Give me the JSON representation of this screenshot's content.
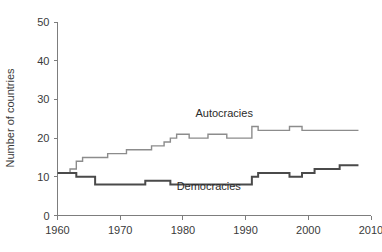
{
  "chart_data": {
    "type": "line",
    "title": "",
    "xlabel": "",
    "ylabel": "Number of countries",
    "xlim": [
      1960,
      2010
    ],
    "ylim": [
      0,
      50
    ],
    "grid": false,
    "legend_position": "inline-annotations",
    "xticks": [
      1960,
      1970,
      1980,
      1990,
      2000,
      2010
    ],
    "xtick_labels": [
      "1960",
      "1970",
      "1980",
      "1990",
      "2000",
      "2010"
    ],
    "yticks": [
      0,
      10,
      20,
      30,
      40,
      50
    ],
    "ytick_labels": [
      "0",
      "10",
      "20",
      "30",
      "40",
      "50"
    ],
    "series": [
      {
        "name": "Autocracies",
        "color": "#8c8c8c",
        "linewidth": 1.4,
        "label_x": 1982,
        "label_y": 25.5,
        "x": [
          1960,
          1961,
          1962,
          1963,
          1964,
          1965,
          1966,
          1967,
          1968,
          1969,
          1970,
          1971,
          1972,
          1973,
          1974,
          1975,
          1976,
          1977,
          1978,
          1979,
          1980,
          1981,
          1982,
          1983,
          1984,
          1985,
          1986,
          1987,
          1988,
          1989,
          1990,
          1991,
          1992,
          1993,
          1994,
          1995,
          1996,
          1997,
          1998,
          1999,
          2000,
          2001,
          2002,
          2003,
          2004,
          2005,
          2006,
          2007,
          2008
        ],
        "y": [
          11,
          11,
          12,
          14,
          15,
          15,
          15,
          15,
          16,
          16,
          16,
          17,
          17,
          17,
          17,
          18,
          18,
          19,
          20,
          21,
          21,
          20,
          20,
          20,
          21,
          21,
          21,
          20,
          20,
          20,
          20,
          23,
          22,
          22,
          22,
          22,
          22,
          23,
          23,
          22,
          22,
          22,
          22,
          22,
          22,
          22,
          22,
          22,
          22
        ]
      },
      {
        "name": "Democracies",
        "color": "#4a4a4a",
        "linewidth": 2.0,
        "label_x": 1979,
        "label_y": 6.6,
        "x": [
          1960,
          1961,
          1962,
          1963,
          1964,
          1965,
          1966,
          1967,
          1968,
          1969,
          1970,
          1971,
          1972,
          1973,
          1974,
          1975,
          1976,
          1977,
          1978,
          1979,
          1980,
          1981,
          1982,
          1983,
          1984,
          1985,
          1986,
          1987,
          1988,
          1989,
          1990,
          1991,
          1992,
          1993,
          1994,
          1995,
          1996,
          1997,
          1998,
          1999,
          2000,
          2001,
          2002,
          2003,
          2004,
          2005,
          2006,
          2007,
          2008
        ],
        "y": [
          11,
          11,
          11,
          10,
          10,
          10,
          8,
          8,
          8,
          8,
          8,
          8,
          8,
          8,
          9,
          9,
          9,
          9,
          8,
          8,
          8,
          8,
          8,
          8,
          8,
          8,
          8,
          8,
          8,
          8,
          8,
          10,
          11,
          11,
          11,
          11,
          11,
          10,
          10,
          11,
          11,
          12,
          12,
          12,
          12,
          13,
          13,
          13,
          13
        ]
      }
    ],
    "annotations": [
      {
        "text": "Autocracies",
        "x": 1982,
        "y": 25.5
      },
      {
        "text": "Democracies",
        "x": 1979,
        "y": 6.6
      }
    ]
  }
}
